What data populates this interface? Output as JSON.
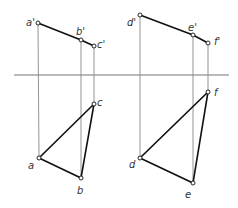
{
  "diagram": {
    "type": "orthographic projection of two triangles",
    "axis": {
      "y": 75,
      "x1": 14,
      "x2": 229,
      "color": "#777777"
    },
    "colors": {
      "edge": "#111111",
      "projector": "#888888",
      "point_fill": "#ffffff"
    },
    "figures": [
      {
        "name": "triangle-abc",
        "front": {
          "points": [
            {
              "id": "a'",
              "x": 38,
              "y": 23,
              "label": "a'",
              "lx": 26,
              "ly": 26
            },
            {
              "id": "b'",
              "x": 81,
              "y": 40,
              "label": "b'",
              "lx": 76,
              "ly": 35
            },
            {
              "id": "c'",
              "x": 94,
              "y": 46,
              "label": "c'",
              "lx": 97,
              "ly": 48
            }
          ]
        },
        "top": {
          "points": [
            {
              "id": "a",
              "x": 39,
              "y": 158,
              "label": "a",
              "lx": 28,
              "ly": 169
            },
            {
              "id": "b",
              "x": 81,
              "y": 178,
              "label": "b",
              "lx": 77,
              "ly": 194
            },
            {
              "id": "c",
              "x": 94,
              "y": 104,
              "label": "c",
              "lx": 97,
              "ly": 106
            }
          ]
        }
      },
      {
        "name": "triangle-def",
        "front": {
          "points": [
            {
              "id": "d'",
              "x": 140,
              "y": 15,
              "label": "d'",
              "lx": 127,
              "ly": 26
            },
            {
              "id": "e'",
              "x": 193,
              "y": 35,
              "label": "e'",
              "lx": 188,
              "ly": 31
            },
            {
              "id": "f'",
              "x": 208,
              "y": 43,
              "label": "f'",
              "lx": 214,
              "ly": 45
            }
          ]
        },
        "top": {
          "points": [
            {
              "id": "d",
              "x": 140,
              "y": 158,
              "label": "d",
              "lx": 129,
              "ly": 168
            },
            {
              "id": "e",
              "x": 193,
              "y": 183,
              "label": "e",
              "lx": 185,
              "ly": 198
            },
            {
              "id": "f",
              "x": 208,
              "y": 92,
              "label": "f",
              "lx": 214,
              "ly": 96
            }
          ]
        }
      }
    ]
  }
}
